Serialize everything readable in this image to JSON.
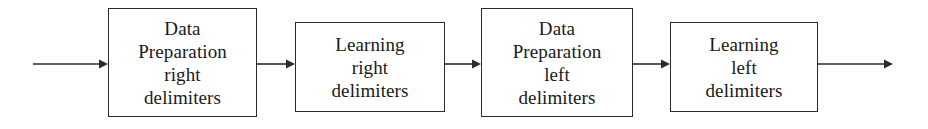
{
  "diagram": {
    "type": "flowchart",
    "orientation": "left-to-right",
    "background_color": "#ffffff",
    "line_color": "#2b2b2b",
    "text_color": "#1a1a1a",
    "boxes": [
      {
        "id": "data-preparation-right-delimiters",
        "lines": [
          "Data",
          "Preparation",
          "right",
          "delimiters"
        ],
        "x": 108,
        "y": 8,
        "width": 149,
        "height": 109
      },
      {
        "id": "learning-right-delimiters",
        "lines": [
          "Learning",
          "right",
          "delimiters"
        ],
        "x": 295,
        "y": 22,
        "width": 150,
        "height": 90
      },
      {
        "id": "data-preparation-left-delimiters",
        "lines": [
          "Data",
          "Preparation",
          "left",
          "delimiters"
        ],
        "x": 481,
        "y": 8,
        "width": 152,
        "height": 109
      },
      {
        "id": "learning-left-delimiters",
        "lines": [
          "Learning",
          "left",
          "delimiters"
        ],
        "x": 670,
        "y": 22,
        "width": 148,
        "height": 90
      }
    ],
    "arrows": [
      {
        "id": "arrow-input",
        "x": 33,
        "y": 58,
        "length": 75,
        "has_head": true
      },
      {
        "id": "arrow-1-to-2",
        "x": 257,
        "y": 58,
        "length": 38,
        "has_head": true
      },
      {
        "id": "arrow-2-to-3",
        "x": 445,
        "y": 58,
        "length": 36,
        "has_head": true
      },
      {
        "id": "arrow-3-to-4",
        "x": 633,
        "y": 58,
        "length": 37,
        "has_head": true
      },
      {
        "id": "arrow-output",
        "x": 818,
        "y": 58,
        "length": 75,
        "has_head": true
      }
    ]
  }
}
